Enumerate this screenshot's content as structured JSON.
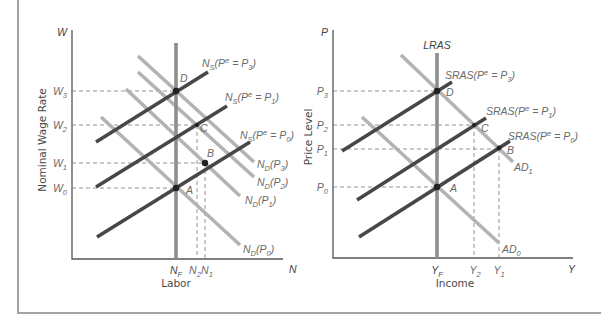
{
  "labor_market": {
    "y_axis": {
      "symbol": "W",
      "title": "Nominal Wage Rate",
      "ticks": {
        "w3": "W_{3}",
        "w2": "W_{2}",
        "w1": "W_{1}",
        "w0": "W_{0}"
      }
    },
    "x_axis": {
      "symbol": "N",
      "title": "Labor",
      "ticks": {
        "nf": "N_{F}",
        "n2": "N_{2}",
        "n1": "N_{1}"
      }
    },
    "points": {
      "d": "D",
      "c": "C",
      "b": "B",
      "a": "A"
    },
    "labor_supply": {
      "p3": "N_{S}(P^{e} = P_{3})",
      "p1": "N_{S}(P^{e} = P_{1})",
      "p0": "N_{S}(P^{e} = P_{0})"
    },
    "labor_demand": {
      "p3": "N_{D}(P_{3})",
      "p2": "N_{D}(P_{2})",
      "p1": "N_{D}(P_{1})",
      "p0": "N_{D}(P_{0})"
    }
  },
  "goods_market": {
    "y_axis": {
      "symbol": "P",
      "title": "Price Level",
      "ticks": {
        "p3": "P_{3}",
        "p2": "P_{2}",
        "p1": "P_{1}",
        "p0": "P_{0}"
      }
    },
    "x_axis": {
      "symbol": "Y",
      "title": "Income",
      "ticks": {
        "yf": "Y_{F}",
        "y2": "Y_{2}",
        "y1": "Y_{1}"
      }
    },
    "points": {
      "d": "D",
      "c": "C",
      "b": "B",
      "a": "A"
    },
    "lras_label": "LRAS",
    "sras": {
      "p3": "SRAS(P^{e} = P_{3})",
      "p1": "SRAS(P^{e} = P_{1})",
      "p0": "SRAS(P^{e} = P_{0})"
    },
    "ad": {
      "ad1": "AD_{1}",
      "ad0": "AD_{0}"
    }
  },
  "colors": {
    "supply_curves": "#474747",
    "demand_curves": "#b3b3b3",
    "vertical_curves": "#8e8e8e",
    "guide_lines": "#7a7a7a"
  }
}
